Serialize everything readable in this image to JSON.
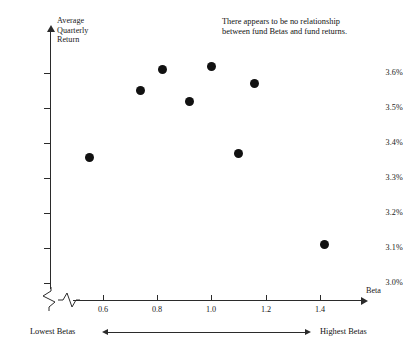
{
  "chart_data": {
    "type": "scatter",
    "title": "",
    "xlabel": "Beta",
    "ylabel": "Average Quarterly Return",
    "ylabel_lines": [
      "Average",
      "Quarterly",
      "Return"
    ],
    "xlim": [
      0.5,
      1.5
    ],
    "ylim": [
      2.95,
      3.65
    ],
    "grid": false,
    "legend": null,
    "x_ticks": [
      "0.6",
      "0.8",
      "1.0",
      "1.2",
      "1.4"
    ],
    "x_tick_values": [
      0.6,
      0.8,
      1.0,
      1.2,
      1.4
    ],
    "y_ticks": [
      "3.6%",
      "3.5%",
      "3.4%",
      "3.3%",
      "3.2%",
      "3.1%",
      "3.0%"
    ],
    "y_tick_values": [
      3.6,
      3.5,
      3.4,
      3.3,
      3.2,
      3.1,
      3.0
    ],
    "axis_break_x": true,
    "axis_break_y": true,
    "points": [
      {
        "beta": 0.55,
        "return": 3.36
      },
      {
        "beta": 0.74,
        "return": 3.55
      },
      {
        "beta": 0.82,
        "return": 3.61
      },
      {
        "beta": 0.92,
        "return": 3.52
      },
      {
        "beta": 1.0,
        "return": 3.62
      },
      {
        "beta": 1.1,
        "return": 3.37
      },
      {
        "beta": 1.16,
        "return": 3.57
      },
      {
        "beta": 1.42,
        "return": 3.11
      }
    ],
    "annotations": [
      {
        "name": "no-relationship-note",
        "lines": [
          "There appears to be no relationship",
          "between fund Betas and fund returns."
        ]
      }
    ],
    "range_note": {
      "left_label": "Lowest Betas",
      "right_label": "Highest Betas"
    },
    "colors": {
      "marker": "#111111",
      "axis": "#2b2b2b",
      "text": "#111111",
      "background": "#ffffff"
    }
  }
}
